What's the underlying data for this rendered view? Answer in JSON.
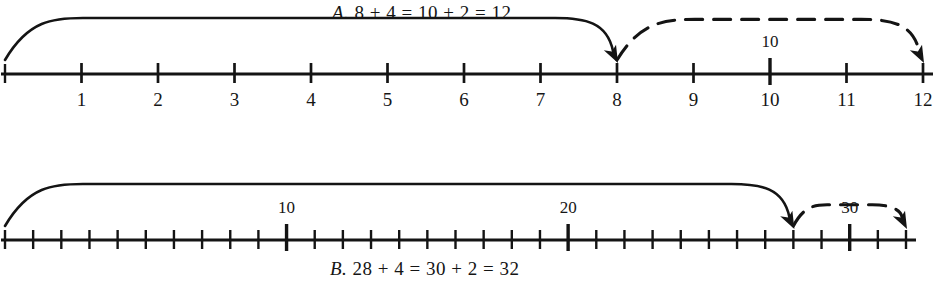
{
  "figure": {
    "background_color": "#ffffff",
    "ink_color": "#141414",
    "width": 933,
    "height": 290
  },
  "panels": [
    {
      "id": "panel-a",
      "caption_lead": "A.",
      "caption_text": "8 + 4 = 10 + 2 = 12",
      "caption_position": "above",
      "line": {
        "start_value": 0,
        "end_value": 12,
        "x_start": 5,
        "x_end": 923,
        "y": 74,
        "tick_step": 1,
        "major_tick_step": 1
      },
      "tick_labels": [
        "1",
        "2",
        "3",
        "4",
        "5",
        "6",
        "7",
        "8",
        "9",
        "10",
        "11",
        "12"
      ],
      "tick_label_values": [
        1,
        2,
        3,
        4,
        5,
        6,
        7,
        8,
        9,
        10,
        11,
        12
      ],
      "highlight_labels": [
        {
          "text": "10",
          "value": 10,
          "position": "above"
        }
      ],
      "arcs": [
        {
          "name": "solid-jump-arc",
          "style": "solid",
          "from_value": 0,
          "to_value": 8,
          "arrowhead": true,
          "direction": "right"
        },
        {
          "name": "dashed-jump-arc",
          "style": "dashed",
          "from_value": 8,
          "to_value": 12,
          "arrowhead": true,
          "direction": "right"
        }
      ]
    },
    {
      "id": "panel-b",
      "caption_lead": "B.",
      "caption_text": "28 + 4 = 30 + 2 = 32",
      "caption_position": "below",
      "line": {
        "start_value": 0,
        "end_value": 32,
        "x_start": 5,
        "x_end": 906,
        "y": 240,
        "tick_step": 1,
        "major_tick_step": 10
      },
      "tick_labels": [],
      "tick_label_values": [],
      "highlight_labels": [
        {
          "text": "10",
          "value": 10,
          "position": "above"
        },
        {
          "text": "20",
          "value": 20,
          "position": "above"
        },
        {
          "text": "30",
          "value": 30,
          "position": "above"
        }
      ],
      "arcs": [
        {
          "name": "solid-jump-arc",
          "style": "solid",
          "from_value": 0,
          "to_value": 28,
          "arrowhead": true,
          "direction": "right"
        },
        {
          "name": "dashed-jump-arc",
          "style": "dashed",
          "from_value": 28,
          "to_value": 32,
          "arrowhead": true,
          "direction": "right"
        }
      ]
    }
  ],
  "chart_data": {
    "type": "line",
    "xlabel": "",
    "ylabel": "",
    "series": [
      {
        "name": "A. 8 + 4 = 10 + 2 = 12",
        "x": [
          0,
          8,
          12
        ],
        "values": [
          0,
          8,
          12
        ],
        "annotations": [
          "start at 0",
          "jump to 8",
          "jump 4 more to 12"
        ]
      },
      {
        "name": "B. 28 + 4 = 30 + 2 = 32",
        "x": [
          0,
          28,
          32
        ],
        "values": [
          0,
          28,
          32
        ],
        "annotations": [
          "start at 0",
          "jump to 28",
          "jump 4 more to 32"
        ]
      }
    ],
    "xlim_a": [
      0,
      12
    ],
    "xlim_b": [
      0,
      32
    ],
    "grid": false,
    "legend": "none"
  }
}
